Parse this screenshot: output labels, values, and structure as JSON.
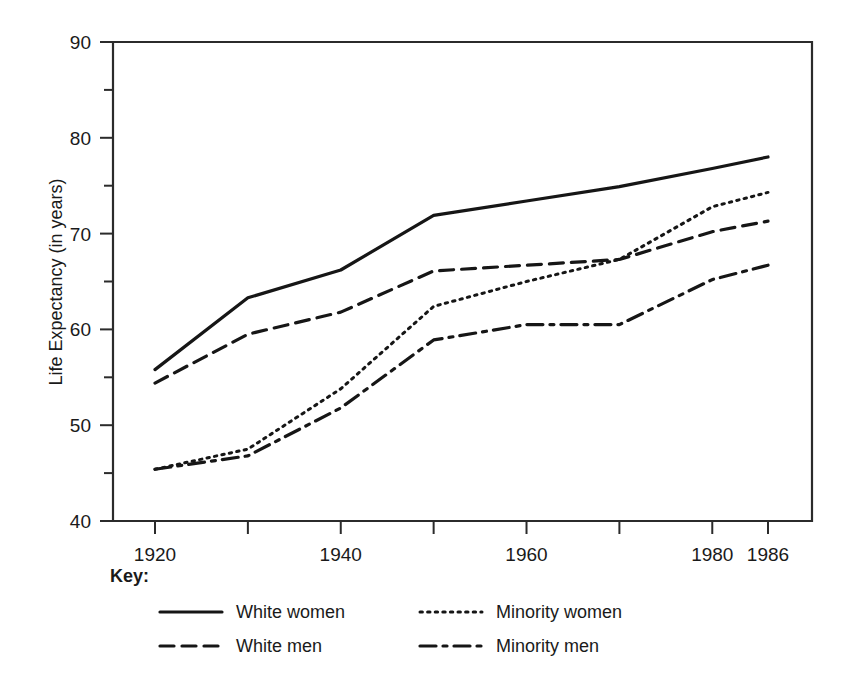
{
  "chart_data": {
    "type": "line",
    "title": "",
    "xlabel": "",
    "ylabel": "Life Expectancy (in years)",
    "xlim": [
      1920,
      1986
    ],
    "ylim": [
      40,
      90
    ],
    "grid": false,
    "legend_position": "below-left",
    "legend_heading": "Key:",
    "x": [
      1920,
      1930,
      1940,
      1950,
      1960,
      1970,
      1980,
      1986
    ],
    "xtick_values": [
      1920,
      1930,
      1940,
      1950,
      1960,
      1970,
      1980,
      1986
    ],
    "xtick_labels": [
      "1920",
      "",
      "1940",
      "",
      "1960",
      "",
      "1980",
      "1986"
    ],
    "xtick_labels_shown": [
      "1920",
      "1940",
      "1960",
      "1980",
      "1986"
    ],
    "ytick_values": [
      40,
      45,
      50,
      55,
      60,
      65,
      70,
      75,
      80,
      85,
      90
    ],
    "ytick_labels_major": [
      "40",
      "50",
      "60",
      "70",
      "80",
      "90"
    ],
    "ytick_values_major": [
      40,
      50,
      60,
      70,
      80,
      90
    ],
    "ytick_values_minor": [
      45,
      55,
      65,
      75,
      85
    ],
    "series": [
      {
        "name": "White women",
        "style": "solid",
        "color": "#161616",
        "values": [
          55.8,
          63.3,
          66.2,
          71.9,
          73.4,
          74.9,
          76.8,
          78.0
        ]
      },
      {
        "name": "White men",
        "style": "dashed",
        "color": "#161616",
        "values": [
          54.4,
          59.5,
          61.8,
          66.1,
          66.7,
          67.3,
          70.2,
          71.3
        ]
      },
      {
        "name": "Minority women",
        "style": "dotted",
        "color": "#161616",
        "values": [
          45.4,
          47.5,
          53.8,
          62.4,
          65.0,
          67.3,
          72.8,
          74.3
        ]
      },
      {
        "name": "Minority men",
        "style": "dashdot",
        "color": "#161616",
        "values": [
          45.4,
          46.8,
          51.8,
          58.9,
          60.5,
          60.5,
          65.2,
          66.7
        ]
      }
    ]
  },
  "legend": {
    "heading": "Key:",
    "entries": [
      {
        "label": "White women",
        "style": "solid"
      },
      {
        "label": "White men",
        "style": "dashed"
      },
      {
        "label": "Minority women",
        "style": "dotted"
      },
      {
        "label": "Minority men",
        "style": "dashdot"
      }
    ]
  },
  "axes": {
    "y_title": "Life Expectancy (in years)"
  }
}
